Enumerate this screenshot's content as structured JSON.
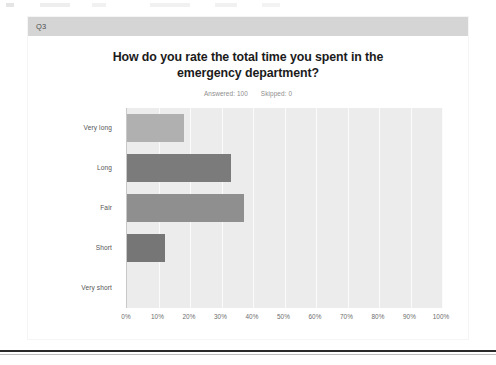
{
  "card": {
    "question_number": "Q3",
    "title": "How do you rate the total time you spent in the emergency department?",
    "answered_label": "Answered: 100",
    "skipped_label": "Skipped: 0"
  },
  "colors": {
    "header_bar": "#d5d5d5",
    "plot_background": "#ececec",
    "gridline": "#fbfbfb",
    "bar_very_long": "#b0b0b0",
    "bar_long": "#7b7b7b",
    "bar_fair": "#8f8f8f",
    "bar_short": "#767676",
    "bar_very_short": "#ececec",
    "title_text": "#1b1b1b",
    "meta_text": "#8d8d8d",
    "axis_text": "#6d6d6d"
  },
  "chart_data": {
    "type": "bar",
    "orientation": "horizontal",
    "title": "How do you rate the total time you spent in the emergency department?",
    "xlabel": "",
    "ylabel": "",
    "categories": [
      "Very long",
      "Long",
      "Fair",
      "Short",
      "Very short"
    ],
    "values": [
      18,
      33,
      37,
      12,
      0
    ],
    "value_unit": "percent",
    "xlim": [
      0,
      100
    ],
    "xticks": [
      "0%",
      "10%",
      "20%",
      "30%",
      "40%",
      "50%",
      "60%",
      "70%",
      "80%",
      "90%",
      "100%"
    ],
    "grid": true,
    "legend": "none",
    "bar_colors": [
      "#b0b0b0",
      "#7b7b7b",
      "#8f8f8f",
      "#767676",
      "#ececec"
    ],
    "answered": 100,
    "skipped": 0
  }
}
